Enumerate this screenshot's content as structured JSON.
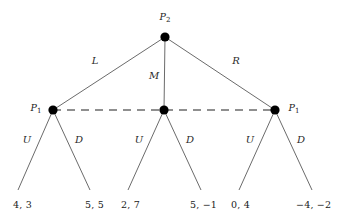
{
  "figure": {
    "kind": "extensive-form-game-tree",
    "width": 342,
    "height": 224,
    "background_color": "#ffffff",
    "line_color": "#6b6b6b",
    "node_color": "#000000",
    "text_color": "#1a1a1a"
  },
  "nodes": {
    "root": {
      "id": "root",
      "player_label": "P",
      "player_subscript": "2",
      "x": 165,
      "y": 37,
      "radius": 4.6,
      "label_x": 165,
      "label_y": 17,
      "label_position": "above"
    },
    "left": {
      "id": "left",
      "player_label": "P",
      "player_subscript": "1",
      "x": 53,
      "y": 110,
      "radius": 4.6,
      "label_x": 36,
      "label_y": 108,
      "label_position": "left"
    },
    "middle": {
      "id": "middle",
      "player_label": "",
      "player_subscript": "",
      "x": 164,
      "y": 110,
      "radius": 4.6,
      "label_x": null,
      "label_y": null,
      "label_position": "none"
    },
    "right": {
      "id": "right",
      "player_label": "P",
      "player_subscript": "1",
      "x": 275,
      "y": 110,
      "radius": 4.6,
      "label_x": 294,
      "label_y": 108,
      "label_position": "right"
    }
  },
  "edges": {
    "top": [
      {
        "id": "edge-L",
        "label": "L",
        "from": "root",
        "to": "left",
        "x1": 165,
        "y1": 37,
        "x2": 53,
        "y2": 110,
        "label_x": 95,
        "label_y": 61
      },
      {
        "id": "edge-M",
        "label": "M",
        "from": "root",
        "to": "middle",
        "x1": 165,
        "y1": 37,
        "x2": 164,
        "y2": 110,
        "label_x": 154,
        "label_y": 76
      },
      {
        "id": "edge-R",
        "label": "R",
        "from": "root",
        "to": "right",
        "x1": 165,
        "y1": 37,
        "x2": 275,
        "y2": 110,
        "label_x": 236,
        "label_y": 61
      }
    ],
    "bottom": [
      {
        "id": "edge-left-U",
        "label": "U",
        "from": "left",
        "x1": 53,
        "y1": 110,
        "x2": 18,
        "y2": 190,
        "label_x": 27,
        "label_y": 140
      },
      {
        "id": "edge-left-D",
        "label": "D",
        "from": "left",
        "x1": 53,
        "y1": 110,
        "x2": 90,
        "y2": 190,
        "label_x": 79,
        "label_y": 140
      },
      {
        "id": "edge-middle-U",
        "label": "U",
        "from": "middle",
        "x1": 164,
        "y1": 110,
        "x2": 128,
        "y2": 190,
        "label_x": 139,
        "label_y": 140
      },
      {
        "id": "edge-middle-D",
        "label": "D",
        "from": "middle",
        "x1": 164,
        "y1": 110,
        "x2": 201,
        "y2": 190,
        "label_x": 190,
        "label_y": 140
      },
      {
        "id": "edge-right-U",
        "label": "U",
        "from": "right",
        "x1": 275,
        "y1": 110,
        "x2": 239,
        "y2": 190,
        "label_x": 250,
        "label_y": 140
      },
      {
        "id": "edge-right-D",
        "label": "D",
        "from": "right",
        "x1": 275,
        "y1": 110,
        "x2": 312,
        "y2": 190,
        "label_x": 301,
        "label_y": 140
      }
    ]
  },
  "information_set": {
    "id": "info-set-P1",
    "style": "dashed",
    "dash_pattern": "8 6",
    "x1": 53,
    "y1": 110,
    "x2": 275,
    "y2": 110,
    "connects": [
      "left",
      "middle",
      "right"
    ]
  },
  "payoffs": [
    {
      "id": "payoff-LU",
      "text": "4, 3",
      "p1": 4,
      "p2": 3,
      "x": 13,
      "y": 205,
      "align": "left"
    },
    {
      "id": "payoff-LD",
      "text": "5, 5",
      "p1": 5,
      "p2": 5,
      "x": 85,
      "y": 205,
      "align": "left"
    },
    {
      "id": "payoff-MU",
      "text": "2, 7",
      "p1": 2,
      "p2": 7,
      "x": 121,
      "y": 205,
      "align": "left"
    },
    {
      "id": "payoff-MD",
      "text": "5, −1",
      "p1": 5,
      "p2": -1,
      "x": 190,
      "y": 205,
      "align": "left"
    },
    {
      "id": "payoff-RU",
      "text": "0, 4",
      "p1": 0,
      "p2": 4,
      "x": 231,
      "y": 205,
      "align": "left"
    },
    {
      "id": "payoff-RD",
      "text": "−4, −2",
      "p1": -4,
      "p2": -2,
      "x": 296,
      "y": 205,
      "align": "left"
    }
  ]
}
